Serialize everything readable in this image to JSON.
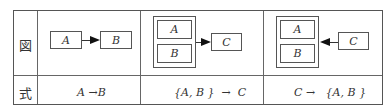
{
  "row_labels": {
    "diagram": "図",
    "formula": "式"
  },
  "columns": [
    {
      "boxes": [
        "A",
        "B"
      ],
      "formula": "A →B"
    },
    {
      "boxes": [
        "A",
        "B",
        "C"
      ],
      "formula": "{A, B }  →  C"
    },
    {
      "boxes": [
        "A",
        "B",
        "C"
      ],
      "formula": "C →   {A, B }"
    }
  ]
}
